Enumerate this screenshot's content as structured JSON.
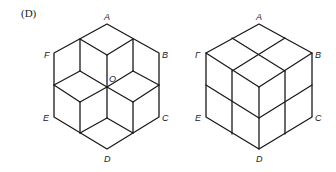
{
  "caption": "(D)",
  "figures": [
    {
      "name": "hexagon-rhombus-star",
      "labels": {
        "A": "A",
        "B": "B",
        "C": "C",
        "D": "D",
        "E": "E",
        "F": "F",
        "O": "O"
      }
    },
    {
      "name": "cube-2x2x2",
      "labels": {
        "A": "A",
        "B": "B",
        "C": "C",
        "D": "D",
        "E": "E",
        "F": "Г"
      }
    }
  ]
}
